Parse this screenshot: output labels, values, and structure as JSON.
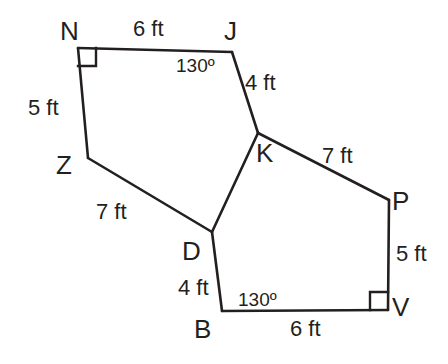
{
  "figure": {
    "background_color": "#ffffff",
    "stroke_color": "#231f20",
    "vertices": [
      {
        "name": "N",
        "label": "N",
        "x": 78,
        "y": 48,
        "label_x": 60,
        "label_y": 18
      },
      {
        "name": "J",
        "label": "J",
        "x": 232,
        "y": 52,
        "label_x": 224,
        "label_y": 18
      },
      {
        "name": "K",
        "label": "K",
        "x": 258,
        "y": 133,
        "label_x": 256,
        "label_y": 140
      },
      {
        "name": "D",
        "label": "D",
        "x": 212,
        "y": 232,
        "label_x": 182,
        "label_y": 238
      },
      {
        "name": "Z",
        "label": "Z",
        "x": 88,
        "y": 158,
        "label_x": 56,
        "label_y": 152
      },
      {
        "name": "P",
        "label": "P",
        "x": 389,
        "y": 200,
        "label_x": 392,
        "label_y": 188
      },
      {
        "name": "V",
        "label": "V",
        "x": 388,
        "y": 310,
        "label_x": 392,
        "label_y": 294
      },
      {
        "name": "B",
        "label": "B",
        "x": 222,
        "y": 311,
        "label_x": 194,
        "label_y": 316
      }
    ],
    "edges": [
      {
        "name": "edge-N-J",
        "from": "N",
        "to": "J",
        "length_label": "6 ft",
        "label_x": 133,
        "label_y": 18
      },
      {
        "name": "edge-J-K",
        "from": "J",
        "to": "K",
        "length_label": "4 ft",
        "label_x": 245,
        "label_y": 72
      },
      {
        "name": "edge-K-D",
        "from": "K",
        "to": "D",
        "length_label": "",
        "label_x": 0,
        "label_y": 0
      },
      {
        "name": "edge-D-Z",
        "from": "D",
        "to": "Z",
        "length_label": "7 ft",
        "label_x": 96,
        "label_y": 201
      },
      {
        "name": "edge-Z-N",
        "from": "Z",
        "to": "N",
        "length_label": "5 ft",
        "label_x": 28,
        "label_y": 97
      },
      {
        "name": "edge-K-P",
        "from": "K",
        "to": "P",
        "length_label": "7 ft",
        "label_x": 322,
        "label_y": 145
      },
      {
        "name": "edge-P-V",
        "from": "P",
        "to": "V",
        "length_label": "5 ft",
        "label_x": 396,
        "label_y": 243
      },
      {
        "name": "edge-V-B",
        "from": "V",
        "to": "B",
        "length_label": "6 ft",
        "label_x": 290,
        "label_y": 318
      },
      {
        "name": "edge-B-D",
        "from": "B",
        "to": "D",
        "length_label": "4 ft",
        "label_x": 178,
        "label_y": 277
      }
    ],
    "angles": [
      {
        "name": "angle-at-J",
        "vertex": "J",
        "value": "130º",
        "label_x": 176,
        "label_y": 56
      },
      {
        "name": "angle-at-B",
        "vertex": "B",
        "value": "130º",
        "label_x": 238,
        "label_y": 290
      }
    ],
    "right_angles": [
      {
        "name": "right-angle-marker-N",
        "vertex": "N",
        "points": "78,66 96,66 96,48"
      },
      {
        "name": "right-angle-marker-V",
        "vertex": "V",
        "points": "370,310 370,292 388,292"
      }
    ]
  }
}
